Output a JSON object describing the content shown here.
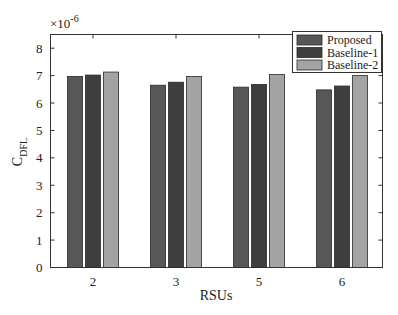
{
  "chart_data": {
    "type": "bar",
    "title": "",
    "xlabel": "RSUs",
    "ylabel": "C_DFL",
    "ylabel_main": "C",
    "ylabel_sub": "DFL",
    "y_exponent": "×10",
    "y_exponent_power": "-6",
    "ylim": [
      0,
      8.5
    ],
    "yticks": [
      0,
      1,
      2,
      3,
      4,
      5,
      6,
      7,
      8
    ],
    "categories": [
      "2",
      "3",
      "5",
      "6"
    ],
    "series": [
      {
        "name": "Proposed",
        "color": "#575757",
        "values": [
          6.97,
          6.65,
          6.58,
          6.48
        ]
      },
      {
        "name": "Baseline-1",
        "color": "#3e3e3e",
        "values": [
          7.02,
          6.76,
          6.68,
          6.62
        ]
      },
      {
        "name": "Baseline-2",
        "color": "#a3a3a3",
        "values": [
          7.13,
          6.97,
          7.04,
          7.0
        ]
      }
    ],
    "grid": false,
    "legend_position": "upper right"
  },
  "legend": {
    "items": [
      "Proposed",
      "Baseline-1",
      "Baseline-2"
    ]
  },
  "axes": {
    "xlabel": "RSUs",
    "ytick_labels": [
      "0",
      "1",
      "2",
      "3",
      "4",
      "5",
      "6",
      "7",
      "8"
    ],
    "xtick_labels": [
      "2",
      "3",
      "5",
      "6"
    ],
    "exponent_base": "×10",
    "exponent_power": "-6"
  }
}
